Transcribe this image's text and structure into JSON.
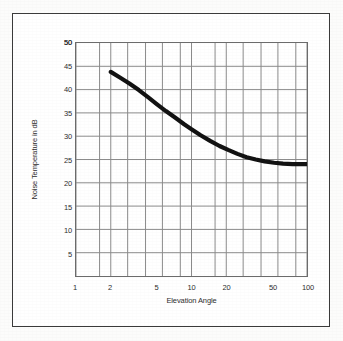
{
  "chart_data": {
    "type": "line",
    "title": "",
    "xlabel": "Elevation Angle",
    "ylabel": "Noise Temperature in dB",
    "xscale": "log",
    "xlim": [
      1,
      100
    ],
    "ylim": [
      0,
      50
    ],
    "grid": true,
    "legend": false,
    "xticks": [
      1,
      2,
      5,
      10,
      20,
      50,
      100
    ],
    "xtick_labels": [
      "1",
      "2",
      "5",
      "10",
      "20",
      "50",
      "100"
    ],
    "yticks": [
      5,
      10,
      15,
      20,
      25,
      30,
      35,
      40,
      45,
      50
    ],
    "ytick_labels": [
      "5",
      "10",
      "15",
      "20",
      "25",
      "30",
      "35",
      "40",
      "45",
      "50"
    ],
    "series": [
      {
        "name": "Noise Temperature",
        "x": [
          2.0,
          2.4,
          2.9,
          3.5,
          4.2,
          5.0,
          6.0,
          7.2,
          8.7,
          10.0,
          12.0,
          14.5,
          17.5,
          21.0,
          25.0,
          30.0,
          36.0,
          43.0,
          52.0,
          62.0,
          75.0,
          90.0,
          100.0
        ],
        "y": [
          43.8,
          42.6,
          41.3,
          39.9,
          38.4,
          36.9,
          35.4,
          34.0,
          32.5,
          31.5,
          30.2,
          29.0,
          27.9,
          27.0,
          26.2,
          25.5,
          25.0,
          24.6,
          24.3,
          24.1,
          24.0,
          24.0,
          24.0
        ]
      }
    ]
  },
  "figure": {
    "border_color": "#3a3a3a",
    "grid_color": "#8a8a8a",
    "curve_color": "#111111"
  }
}
